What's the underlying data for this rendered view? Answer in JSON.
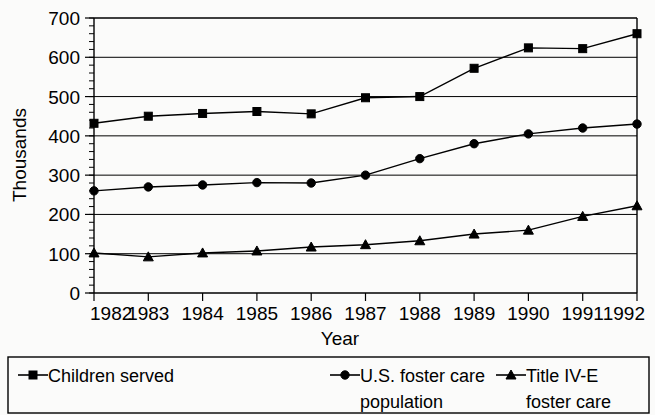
{
  "chart_data": {
    "type": "line",
    "title": "",
    "xlabel": "Year",
    "ylabel": "Thousands",
    "categories": [
      "1982",
      "1983",
      "1984",
      "1985",
      "1986",
      "1987",
      "1988",
      "1989",
      "1990",
      "1991",
      "1992"
    ],
    "x": [
      1982,
      1983,
      1984,
      1985,
      1986,
      1987,
      1988,
      1989,
      1990,
      1991,
      1992
    ],
    "xlim": [
      1982,
      1992
    ],
    "ylim": [
      0,
      700
    ],
    "ytick_labels": [
      "0",
      "100",
      "200",
      "300",
      "400",
      "500",
      "600",
      "700"
    ],
    "ytick_values": [
      0,
      100,
      200,
      300,
      400,
      500,
      600,
      700
    ],
    "ytick_interval": 100,
    "minor_tick_interval": 20,
    "grid": "horizontal",
    "legend_position": "bottom",
    "series": [
      {
        "name": "Children served",
        "marker": "square",
        "values": [
          432,
          450,
          457,
          462,
          456,
          497,
          500,
          572,
          624,
          622,
          660
        ]
      },
      {
        "name": "U.S. foster care population",
        "marker": "circle",
        "values": [
          260,
          270,
          275,
          281,
          280,
          300,
          342,
          380,
          405,
          420,
          430
        ]
      },
      {
        "name": "Title IV-E foster care",
        "marker": "triangle",
        "values": [
          102,
          92,
          102,
          107,
          117,
          123,
          133,
          150,
          160,
          195,
          222
        ]
      }
    ]
  },
  "legend": {
    "entries": [
      {
        "label_line1": "Children served",
        "label_line2": ""
      },
      {
        "label_line1": "U.S. foster care",
        "label_line2": "population"
      },
      {
        "label_line1": "Title IV-E",
        "label_line2": "foster care"
      }
    ]
  },
  "colors": {
    "ink": "#000000",
    "background": "#fbfbfa"
  }
}
